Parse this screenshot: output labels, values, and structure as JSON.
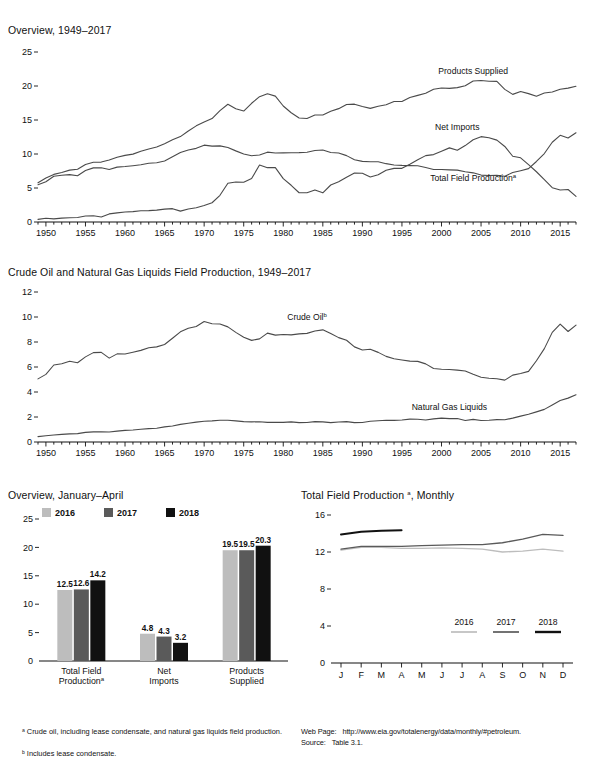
{
  "page": {
    "footnotes_left": [
      "ᵃ Crude oil, including lease condensate, and natural gas liquids field production.",
      "ᵇ Includes lease condensate."
    ],
    "web_page_label": "Web Page:",
    "web_page_url": "http://www.eia.gov/totalenergy/data/monthly/#petroleum.",
    "source_label": "Source:",
    "source_value": "Table 3.1."
  },
  "colors": {
    "line": "#4a4a4a",
    "dark_line": "#222222",
    "y2016": "#bdbdbd",
    "y2017": "#5a5a5a",
    "y2018": "#111111",
    "axis": "#111111"
  },
  "chart_data": [
    {
      "id": "overview-annual",
      "type": "line",
      "title": "Overview, 1949–2017",
      "xlabel": "",
      "ylabel": "",
      "ylim": [
        0,
        25
      ],
      "yticks": [
        0,
        5,
        10,
        15,
        20,
        25
      ],
      "xlim": [
        1949,
        2017
      ],
      "xticks": [
        1950,
        1955,
        1960,
        1965,
        1970,
        1975,
        1980,
        1985,
        1990,
        1995,
        2000,
        2005,
        2010,
        2015
      ],
      "minor_tick_step": 1,
      "grid": false,
      "legend": "inline-labels",
      "annotations": [
        {
          "text": "Products Supplied",
          "x": 2004,
          "y": 21.8
        },
        {
          "text": "Net Imports",
          "x": 2002,
          "y": 13.6
        },
        {
          "text": "Total Field Production",
          "sup": "a",
          "x": 2004,
          "y": 6.0
        }
      ],
      "x": [
        1949,
        1950,
        1951,
        1952,
        1953,
        1954,
        1955,
        1956,
        1957,
        1958,
        1959,
        1960,
        1961,
        1962,
        1963,
        1964,
        1965,
        1966,
        1967,
        1968,
        1969,
        1970,
        1971,
        1972,
        1973,
        1974,
        1975,
        1976,
        1977,
        1978,
        1979,
        1980,
        1981,
        1982,
        1983,
        1984,
        1985,
        1986,
        1987,
        1988,
        1989,
        1990,
        1991,
        1992,
        1993,
        1994,
        1995,
        1996,
        1997,
        1998,
        1999,
        2000,
        2001,
        2002,
        2003,
        2004,
        2005,
        2006,
        2007,
        2008,
        2009,
        2010,
        2011,
        2012,
        2013,
        2014,
        2015,
        2016,
        2017
      ],
      "series": [
        {
          "name": "Products Supplied",
          "values": [
            5.76,
            6.46,
            7.0,
            7.27,
            7.63,
            7.76,
            8.46,
            8.78,
            8.81,
            9.12,
            9.53,
            9.8,
            9.98,
            10.4,
            10.74,
            11.02,
            11.51,
            12.08,
            12.56,
            13.39,
            14.14,
            14.7,
            15.21,
            16.37,
            17.31,
            16.65,
            16.32,
            17.46,
            18.43,
            18.85,
            18.51,
            17.06,
            16.06,
            15.3,
            15.23,
            15.73,
            15.73,
            16.28,
            16.67,
            17.28,
            17.33,
            16.99,
            16.71,
            17.03,
            17.24,
            17.72,
            17.72,
            18.31,
            18.62,
            18.92,
            19.52,
            19.7,
            19.65,
            19.76,
            20.03,
            20.73,
            20.8,
            20.69,
            20.68,
            19.5,
            18.77,
            19.18,
            18.88,
            18.49,
            18.96,
            19.11,
            19.53,
            19.69,
            19.96
          ]
        },
        {
          "name": "Net Imports",
          "values": [
            0.39,
            0.55,
            0.46,
            0.57,
            0.63,
            0.66,
            0.88,
            0.93,
            0.74,
            1.19,
            1.34,
            1.46,
            1.52,
            1.66,
            1.67,
            1.75,
            1.9,
            1.96,
            1.6,
            1.92,
            2.1,
            2.42,
            2.83,
            3.93,
            5.7,
            5.89,
            5.85,
            6.4,
            8.37,
            7.99,
            7.99,
            6.37,
            5.4,
            4.3,
            4.31,
            4.72,
            4.29,
            5.44,
            5.91,
            6.59,
            7.2,
            7.16,
            6.63,
            6.94,
            7.62,
            7.89,
            7.89,
            8.5,
            9.16,
            9.76,
            9.91,
            10.42,
            10.9,
            10.55,
            11.24,
            12.1,
            12.55,
            12.39,
            12.04,
            11.11,
            9.67,
            9.44,
            8.44,
            7.39,
            6.24,
            5.05,
            4.71,
            4.78,
            3.77
          ]
        },
        {
          "name": "Total Field Production",
          "values": [
            5.48,
            5.91,
            6.72,
            6.87,
            6.96,
            6.81,
            7.57,
            7.96,
            7.98,
            7.71,
            8.07,
            8.16,
            8.28,
            8.42,
            8.64,
            8.72,
            8.96,
            9.58,
            10.22,
            10.6,
            10.83,
            11.3,
            11.16,
            11.19,
            10.95,
            10.46,
            10.01,
            9.74,
            9.86,
            10.27,
            10.14,
            10.17,
            10.18,
            10.2,
            10.25,
            10.51,
            10.58,
            10.23,
            10.14,
            9.76,
            9.16,
            8.91,
            8.86,
            8.87,
            8.58,
            8.39,
            8.32,
            8.29,
            8.27,
            8.01,
            7.73,
            7.73,
            7.67,
            7.63,
            7.4,
            7.23,
            6.9,
            6.84,
            6.86,
            6.73,
            7.27,
            7.55,
            7.85,
            8.9,
            10.07,
            11.73,
            12.75,
            12.35,
            13.13
          ]
        }
      ]
    },
    {
      "id": "crude-ngl-annual",
      "type": "line",
      "title": "Crude Oil and Natural Gas Liquids Field Production, 1949–2017",
      "xlabel": "",
      "ylabel": "",
      "ylim": [
        0,
        12
      ],
      "yticks": [
        0,
        2,
        4,
        6,
        8,
        10,
        12
      ],
      "xlim": [
        1949,
        2017
      ],
      "xticks": [
        1950,
        1955,
        1960,
        1965,
        1970,
        1975,
        1980,
        1985,
        1990,
        1995,
        2000,
        2005,
        2010,
        2015
      ],
      "minor_tick_step": 1,
      "grid": false,
      "legend": "inline-labels",
      "annotations": [
        {
          "text": "Crude Oil",
          "sup": "b",
          "x": 1983,
          "y": 9.75
        },
        {
          "text": "Natural Gas Liquids",
          "x": 2001,
          "y": 2.55
        }
      ],
      "x": [
        1949,
        1950,
        1951,
        1952,
        1953,
        1954,
        1955,
        1956,
        1957,
        1958,
        1959,
        1960,
        1961,
        1962,
        1963,
        1964,
        1965,
        1966,
        1967,
        1968,
        1969,
        1970,
        1971,
        1972,
        1973,
        1974,
        1975,
        1976,
        1977,
        1978,
        1979,
        1980,
        1981,
        1982,
        1983,
        1984,
        1985,
        1986,
        1987,
        1988,
        1989,
        1990,
        1991,
        1992,
        1993,
        1994,
        1995,
        1996,
        1997,
        1998,
        1999,
        2000,
        2001,
        2002,
        2003,
        2004,
        2005,
        2006,
        2007,
        2008,
        2009,
        2010,
        2011,
        2012,
        2013,
        2014,
        2015,
        2016,
        2017
      ],
      "series": [
        {
          "name": "Crude Oil",
          "values": [
            5.05,
            5.41,
            6.16,
            6.26,
            6.46,
            6.34,
            6.81,
            7.15,
            7.17,
            6.71,
            7.05,
            7.04,
            7.18,
            7.33,
            7.54,
            7.61,
            7.8,
            8.3,
            8.81,
            9.1,
            9.24,
            9.64,
            9.46,
            9.44,
            9.21,
            8.77,
            8.38,
            8.13,
            8.25,
            8.71,
            8.55,
            8.6,
            8.57,
            8.65,
            8.69,
            8.88,
            8.97,
            8.68,
            8.35,
            8.14,
            7.61,
            7.36,
            7.42,
            7.17,
            6.85,
            6.66,
            6.56,
            6.47,
            6.45,
            6.25,
            5.88,
            5.82,
            5.8,
            5.75,
            5.68,
            5.42,
            5.18,
            5.1,
            5.06,
            4.95,
            5.35,
            5.48,
            5.65,
            6.5,
            7.47,
            8.77,
            9.43,
            8.84,
            9.35
          ]
        },
        {
          "name": "Natural Gas Liquids",
          "values": [
            0.43,
            0.5,
            0.56,
            0.61,
            0.65,
            0.67,
            0.77,
            0.81,
            0.81,
            0.8,
            0.87,
            0.93,
            0.96,
            1.02,
            1.07,
            1.1,
            1.21,
            1.28,
            1.41,
            1.5,
            1.59,
            1.66,
            1.69,
            1.74,
            1.74,
            1.69,
            1.63,
            1.61,
            1.62,
            1.57,
            1.58,
            1.57,
            1.61,
            1.55,
            1.56,
            1.63,
            1.61,
            1.55,
            1.6,
            1.63,
            1.55,
            1.56,
            1.66,
            1.7,
            1.74,
            1.73,
            1.76,
            1.83,
            1.82,
            1.76,
            1.85,
            1.91,
            1.87,
            1.88,
            1.72,
            1.81,
            1.72,
            1.74,
            1.79,
            1.78,
            1.91,
            2.07,
            2.22,
            2.41,
            2.61,
            2.96,
            3.32,
            3.51,
            3.78
          ]
        }
      ]
    },
    {
      "id": "overview-jan-apr-bars",
      "type": "bar",
      "title": "Overview, January–April",
      "xlabel": "",
      "ylabel": "",
      "ylim": [
        0,
        25
      ],
      "yticks": [
        0,
        5,
        10,
        15,
        20,
        25
      ],
      "grid": false,
      "legend_position": "top",
      "legend": [
        "2016",
        "2017",
        "2018"
      ],
      "categories": [
        "Total Field Production",
        "Net Imports",
        "Products Supplied"
      ],
      "category_sup": [
        "a",
        "",
        ""
      ],
      "category_lines": [
        [
          "Total Field",
          "Production"
        ],
        [
          "Net",
          "Imports"
        ],
        [
          "Products",
          "Supplied"
        ]
      ],
      "series": [
        {
          "name": "2016",
          "values": [
            12.5,
            4.8,
            19.5
          ]
        },
        {
          "name": "2017",
          "values": [
            12.6,
            4.3,
            19.5
          ]
        },
        {
          "name": "2018",
          "values": [
            14.2,
            3.2,
            20.3
          ]
        }
      ]
    },
    {
      "id": "total-field-production-monthly",
      "type": "line",
      "title": "Total Field Production, Monthly",
      "title_sup": "a",
      "xlabel": "",
      "ylabel": "",
      "ylim": [
        0,
        16
      ],
      "yticks": [
        0,
        4,
        8,
        12,
        16
      ],
      "grid": false,
      "legend_position": "bottom-right",
      "legend": [
        "2016",
        "2017",
        "2018"
      ],
      "categories": [
        "J",
        "F",
        "M",
        "A",
        "M",
        "J",
        "J",
        "A",
        "S",
        "O",
        "N",
        "D"
      ],
      "series": [
        {
          "name": "2016",
          "values": [
            12.2,
            12.5,
            12.5,
            12.4,
            12.4,
            12.45,
            12.4,
            12.3,
            12.0,
            12.1,
            12.3,
            12.1
          ]
        },
        {
          "name": "2017",
          "values": [
            12.3,
            12.6,
            12.6,
            12.6,
            12.7,
            12.75,
            12.8,
            12.8,
            13.0,
            13.4,
            13.9,
            13.8
          ]
        },
        {
          "name": "2018",
          "values": [
            13.9,
            14.2,
            14.3,
            14.35,
            null,
            null,
            null,
            null,
            null,
            null,
            null,
            null
          ]
        }
      ]
    }
  ]
}
